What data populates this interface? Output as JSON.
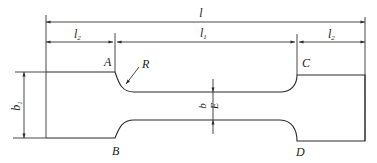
{
  "diagram": {
    "colors": {
      "line": "#2a2a2a",
      "text": "#222222",
      "background": "#ffffff"
    },
    "dimensions": {
      "overall_length": {
        "label": "l",
        "sub": ""
      },
      "grip_length_left": {
        "label": "l",
        "sub": "2"
      },
      "gauge_length": {
        "label": "l",
        "sub": "1"
      },
      "grip_length_right": {
        "label": "l",
        "sub": "2"
      },
      "grip_width": {
        "label": "b",
        "sub": "1"
      },
      "gauge_width": {
        "label": "b",
        "sub": ""
      },
      "thickness_marker": {
        "label": "E"
      },
      "fillet_radius": {
        "label": "R"
      }
    },
    "points": {
      "A": "A",
      "B": "B",
      "C": "C",
      "D": "D"
    }
  }
}
